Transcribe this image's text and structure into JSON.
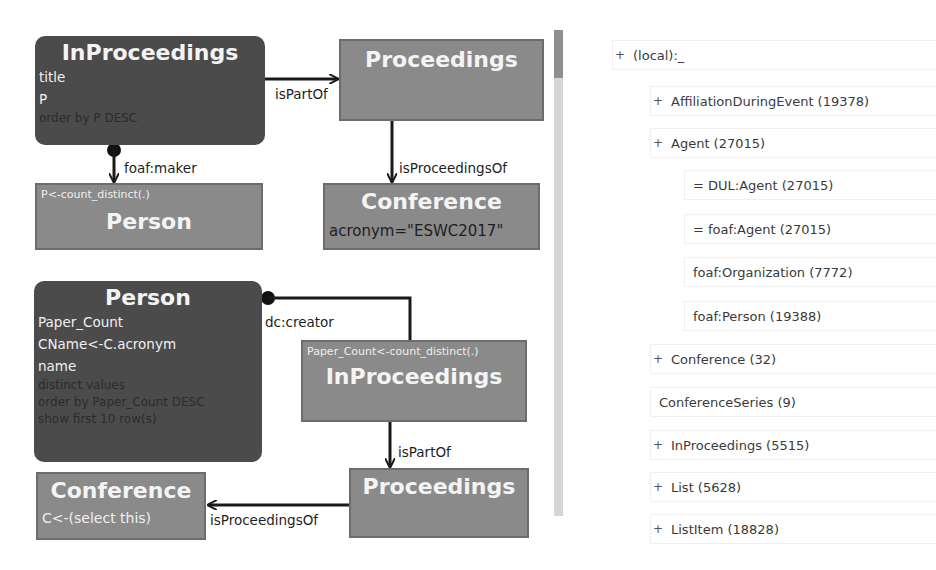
{
  "query_diagram": {
    "query1": {
      "inproceedings": {
        "title": "InProceedings",
        "fields": [
          "title",
          "P"
        ],
        "modifiers": [
          "order by P DESC"
        ]
      },
      "proceedings": {
        "title": "Proceedings"
      },
      "person": {
        "note": "P<-count_distinct(.)",
        "title": "Person"
      },
      "conference": {
        "title": "Conference",
        "filter": "acronym=\"ESWC2017\""
      },
      "edges": {
        "ispartof": "isPartOf",
        "foafmaker": "foaf:maker",
        "isproceedingsof": "isProceedingsOf"
      }
    },
    "query2": {
      "person": {
        "title": "Person",
        "fields": [
          "Paper_Count",
          "CName<-C.acronym",
          "name"
        ],
        "modifiers": [
          "distinct values",
          "order by Paper_Count DESC",
          "show first 10 row(s)"
        ]
      },
      "inproceedings": {
        "note": "Paper_Count<-count_distinct(.)",
        "title": "InProceedings"
      },
      "proceedings": {
        "title": "Proceedings"
      },
      "conference": {
        "title": "Conference",
        "sub": "C<-(select this)"
      },
      "edges": {
        "dccreator": "dc:creator",
        "ispartof": "isPartOf",
        "isproceedingsof": "isProceedingsOf"
      }
    }
  },
  "class_tree": {
    "items": [
      {
        "toggle": "+",
        "label": "(local):_",
        "level": 0
      },
      {
        "toggle": "+",
        "label": "AffiliationDuringEvent (19378)",
        "level": 1
      },
      {
        "toggle": "+",
        "label": "Agent (27015)",
        "level": 1
      },
      {
        "toggle": "",
        "label": "= DUL:Agent (27015)",
        "level": 2
      },
      {
        "toggle": "",
        "label": "= foaf:Agent (27015)",
        "level": 2
      },
      {
        "toggle": "",
        "label": "foaf:Organization (7772)",
        "level": 2
      },
      {
        "toggle": "",
        "label": "foaf:Person (19388)",
        "level": 2
      },
      {
        "toggle": "+",
        "label": "Conference (32)",
        "level": 1
      },
      {
        "toggle": "",
        "label": "ConferenceSeries (9)",
        "level": 1
      },
      {
        "toggle": "+",
        "label": "InProceedings (5515)",
        "level": 1
      },
      {
        "toggle": "+",
        "label": "List (5628)",
        "level": 1
      },
      {
        "toggle": "+",
        "label": "ListItem (18828)",
        "level": 1
      }
    ]
  },
  "colors": {
    "dark_node": "#4b4b4b",
    "mid_node": "#8a8a8a",
    "edge": "#1a1a1a",
    "scroll_track": "#d6d6d6",
    "scroll_thumb": "#8f8f8f"
  }
}
